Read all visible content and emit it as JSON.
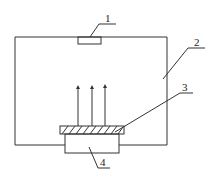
{
  "diagram": {
    "type": "schematic",
    "labels": {
      "part1": "1",
      "part2": "2",
      "part3": "3",
      "part4": "4"
    },
    "components": [
      {
        "id": "1",
        "description": "small rectangle on top wall of chamber"
      },
      {
        "id": "2",
        "description": "chamber enclosure"
      },
      {
        "id": "3",
        "description": "hatched plate"
      },
      {
        "id": "4",
        "description": "base block below plate"
      }
    ],
    "arrows": {
      "count": 3,
      "direction": "up"
    },
    "colors": {
      "line": "#333333",
      "background": "#ffffff"
    }
  }
}
